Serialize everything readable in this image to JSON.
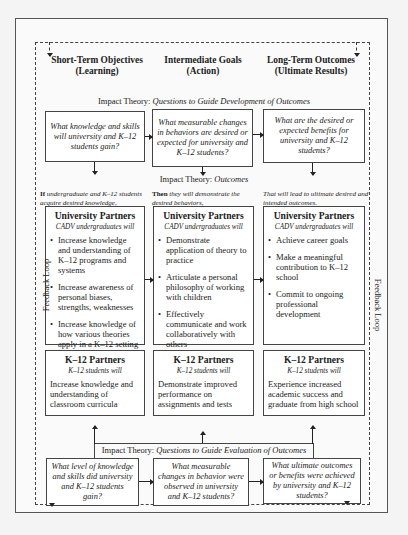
{
  "columns": [
    {
      "title": "Short-Term Objectives",
      "subtitle": "(Learning)"
    },
    {
      "title": "Intermediate Goals",
      "subtitle": "(Action)"
    },
    {
      "title": "Long-Term Outcomes",
      "subtitle": "(Ultimate Results)"
    }
  ],
  "development_heading": {
    "prefix": "Impact Theory:",
    "emphasis": "Questions to Guide Development of Outcomes"
  },
  "development_questions": [
    "What knowledge and skills will university and K–12 students gain?",
    "What measurable changes in behaviors are desired or expected for university and K–12 students?",
    "What are the desired or expected benefits for university and K–12 students?"
  ],
  "outcomes_heading": {
    "prefix": "Impact Theory:",
    "emphasis": "Outcomes"
  },
  "leads": [
    {
      "bold": "If",
      "text": "undergraduate and K–12 students acquire desired knowledge,"
    },
    {
      "bold": "Then",
      "text": "they will demonstrate the desired behaviors,"
    },
    {
      "bold": "",
      "text": "That will lead to ultimate desired and intended outcomes."
    }
  ],
  "university_partners": [
    {
      "title": "University Partners",
      "subtitle": "CADV undergraduates will",
      "items": [
        "Increase knowledge and understanding of K–12 programs and systems",
        "Increase awareness of personal biases, strengths, weaknesses",
        "Increase knowledge of how various theories apply in a K–12 setting"
      ]
    },
    {
      "title": "University Partners",
      "subtitle": "CADV undergraduates will",
      "items": [
        "Demonstrate application of theory to practice",
        "Articulate a personal philosophy of working with children",
        "Effectively communicate and work collaboratively with others"
      ]
    },
    {
      "title": "University Partners",
      "subtitle": "CADV undergraduates will",
      "items": [
        "Achieve career goals",
        "Make a meaningful contribution to K–12 school",
        "Commit to ongoing professional development"
      ]
    }
  ],
  "k12_partners": [
    {
      "title": "K–12 Partners",
      "subtitle": "K–12 students will",
      "text": "Increase knowledge and understanding of classroom curricula"
    },
    {
      "title": "K–12 Partners",
      "subtitle": "K–12 students will",
      "text": "Demonstrate improved performance on assignments and tests"
    },
    {
      "title": "K–12 Partners",
      "subtitle": "K–12 students will",
      "text": "Experience increased academic success and graduate from high school"
    }
  ],
  "evaluation_heading": {
    "prefix": "Impact Theory:",
    "emphasis": "Questions to Guide Evaluation of Outcomes"
  },
  "evaluation_questions": [
    "What level of knowledge and skills did university and K–12 students gain?",
    "What measurable changes in behavior were observed in university and K–12 students?",
    "What ultimate outcomes or benefits were achieved by university and K–12 students?"
  ],
  "side_labels": {
    "left": "Feedback Loop",
    "right": "Feedback Loop"
  }
}
